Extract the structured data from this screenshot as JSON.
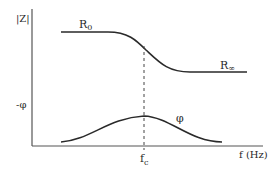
{
  "diagram": {
    "type": "impedance-frequency-response",
    "y_axis_upper_label": "|Z|",
    "y_axis_lower_label": "-φ",
    "x_axis_label": "f (Hz)",
    "magnitude_curve": {
      "low_freq_label_base": "R",
      "low_freq_label_sub": "0",
      "high_freq_label_base": "R",
      "high_freq_label_sub": "∞"
    },
    "phase_curve": {
      "label": "φ"
    },
    "characteristic_frequency": {
      "label_base": "f",
      "label_sub": "c"
    },
    "colors": {
      "line": "#2a2a2a",
      "background": "#ffffff"
    }
  }
}
